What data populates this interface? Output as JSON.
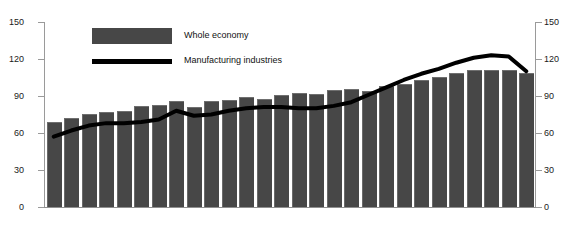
{
  "top_clipped_text": "",
  "chart_data": {
    "type": "bar",
    "title": "",
    "subtitle": "",
    "xlabel": "",
    "ylabel": "",
    "ylim": [
      0,
      150
    ],
    "yticks": [
      0,
      30,
      60,
      90,
      120,
      150
    ],
    "y_right_ticks": [
      0,
      30,
      60,
      90,
      120,
      150
    ],
    "dual_axis": true,
    "grid": false,
    "legend_position": "top-left-inside",
    "categories": [
      "1",
      "2",
      "3",
      "4",
      "5",
      "6",
      "7",
      "8",
      "9",
      "10",
      "11",
      "12",
      "13",
      "14",
      "15",
      "16",
      "17",
      "18",
      "19",
      "20",
      "21",
      "22",
      "23",
      "24",
      "25",
      "26",
      "27",
      "28"
    ],
    "series": [
      {
        "name": "Whole economy",
        "type": "bar",
        "color": "#474747",
        "values": [
          68,
          71,
          75,
          76,
          77,
          81,
          82,
          85,
          80,
          85,
          86,
          88,
          87,
          90,
          92,
          91,
          94,
          95,
          93,
          97,
          99,
          102,
          105,
          108,
          110,
          110,
          110,
          108
        ]
      },
      {
        "name": "Manufacturing industries",
        "type": "line",
        "color": "#000000",
        "values": [
          57,
          62,
          66,
          68,
          68,
          69,
          71,
          78,
          74,
          75,
          78,
          80,
          81,
          81,
          80,
          80,
          82,
          85,
          91,
          97,
          103,
          108,
          112,
          117,
          121,
          123,
          122,
          110
        ]
      }
    ]
  },
  "axis": {
    "left_tick_labels": [
      "150",
      "120",
      "90",
      "60",
      "30",
      "0"
    ],
    "right_tick_labels": [
      "150",
      "120",
      "90",
      "60",
      "30",
      "0"
    ]
  },
  "legend": {
    "items": [
      {
        "label": "Whole economy",
        "swatch": "bar-swatch",
        "color": "#474747"
      },
      {
        "label": "Manufacturing industries",
        "swatch": "line-swatch",
        "color": "#000000"
      }
    ]
  }
}
